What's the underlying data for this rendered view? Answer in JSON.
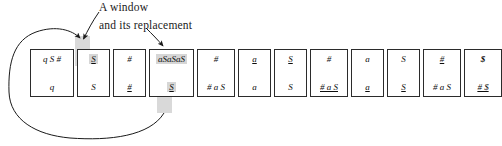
{
  "annotations": {
    "window_label": "A window",
    "replacement_label": "and its replacement"
  },
  "colors": {
    "highlight": "#d6d6d6",
    "ink": "#1a1a1a",
    "cell_border": "#2b2b2b",
    "background": "#ffffff"
  },
  "diagram": {
    "type": "derivation-tape",
    "cell_count": 12,
    "cells": [
      {
        "index": 1,
        "top": "q S #",
        "bottom": "q",
        "top_highlight": false,
        "bottom_highlight": false,
        "width": 44
      },
      {
        "index": 2,
        "top": "S",
        "bottom": "S",
        "top_highlight": true,
        "bottom_highlight": false,
        "width": 33
      },
      {
        "index": 3,
        "top": "#",
        "bottom": "#",
        "top_highlight": false,
        "bottom_highlight": false,
        "width": 33
      },
      {
        "index": 4,
        "top": "aSaSaS",
        "bottom": "S",
        "top_highlight": true,
        "bottom_highlight": true,
        "width": 45
      },
      {
        "index": 5,
        "top": "#",
        "bottom": "# a S",
        "top_highlight": false,
        "bottom_highlight": false,
        "width": 38
      },
      {
        "index": 6,
        "top": "a",
        "bottom": "a",
        "top_highlight": false,
        "bottom_highlight": false,
        "width": 33
      },
      {
        "index": 7,
        "top": "S",
        "bottom": "S",
        "top_highlight": false,
        "bottom_highlight": false,
        "width": 33
      },
      {
        "index": 8,
        "top": "#",
        "bottom": "# a S",
        "top_highlight": false,
        "bottom_highlight": false,
        "width": 38
      },
      {
        "index": 9,
        "top": "a",
        "bottom": "a",
        "top_highlight": false,
        "bottom_highlight": false,
        "width": 33
      },
      {
        "index": 10,
        "top": "S",
        "bottom": "S",
        "top_highlight": false,
        "bottom_highlight": false,
        "width": 33
      },
      {
        "index": 11,
        "top": "#",
        "bottom": "# a S",
        "top_highlight": false,
        "bottom_highlight": false,
        "width": 38
      },
      {
        "index": 12,
        "top": "$",
        "bottom": "# $",
        "top_highlight": false,
        "bottom_highlight": false,
        "width": 38
      }
    ],
    "arrows": [
      {
        "name": "window-pointer",
        "from": "A window label",
        "to": "cell 2 top symbol"
      },
      {
        "name": "replacement-pointer",
        "from": "and its replacement label",
        "to": "cell 4 top symbol"
      },
      {
        "name": "replacement-feedback",
        "from": "cell 4 bottom symbol",
        "to": "cell 2 top symbol"
      }
    ]
  }
}
